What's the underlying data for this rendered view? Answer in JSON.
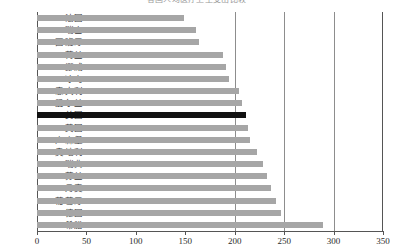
{
  "chart_data": {
    "type": "bar",
    "orientation": "horizontal",
    "title": "各国人均医疗卫生支出比较",
    "xlabel": "",
    "ylabel": "",
    "xlim": [
      0,
      350
    ],
    "xticks": [
      0,
      50,
      100,
      150,
      200,
      250,
      300,
      350
    ],
    "gridlines": [
      200,
      250,
      300
    ],
    "grid": true,
    "legend": null,
    "bar_color": "#a6a6a6",
    "highlight_color": "#111111",
    "highlight_category": "美国",
    "categories": [
      "法国",
      "瑞士",
      "西班牙",
      "荷兰",
      "挪威",
      "冰岛",
      "意大利",
      "爱尔兰",
      "美国",
      "英国",
      "卢森堡",
      "奥地利",
      "瑞典",
      "芬兰",
      "丹麦",
      "葡萄牙",
      "德国",
      "希腊"
    ],
    "values": [
      149,
      161,
      164,
      188,
      191,
      194,
      204,
      207,
      211,
      213,
      215,
      223,
      229,
      233,
      237,
      242,
      247,
      289
    ]
  },
  "axis": {
    "tick_labels": [
      "0",
      "50",
      "100",
      "150",
      "200",
      "250",
      "300",
      "350"
    ]
  }
}
